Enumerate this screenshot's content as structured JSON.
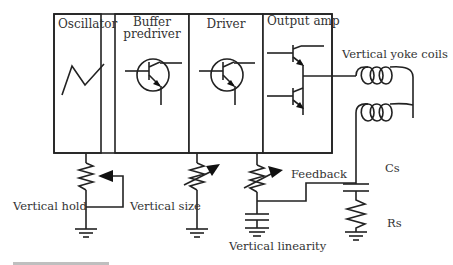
{
  "diagram": {
    "type": "circuit-block-diagram",
    "blocks": [
      {
        "id": "oscillator",
        "label_lines": [
          "Oscillator"
        ],
        "symbol": "sawtooth-waveform"
      },
      {
        "id": "buffer-predriver",
        "label_lines": [
          "Buffer",
          "predriver"
        ],
        "symbol": "npn-transistor"
      },
      {
        "id": "driver",
        "label_lines": [
          "Driver"
        ],
        "symbol": "npn-transistor"
      },
      {
        "id": "output-amp",
        "label_lines": [
          "Output amp"
        ],
        "symbol": "push-pull-transistor-pair"
      }
    ],
    "components": {
      "yoke": {
        "label": "Vertical yoke coils",
        "symbol": "two-inductors-series"
      },
      "cs": {
        "label": "Cs",
        "symbol": "capacitor"
      },
      "rs": {
        "label": "Rs",
        "symbol": "resistor"
      },
      "vertical_hold": {
        "label": "Vertical hold",
        "symbol": "potentiometer"
      },
      "vertical_size": {
        "label": "Vertical size",
        "symbol": "variable-resistor"
      },
      "vertical_linearity": {
        "label": "Vertical linearity",
        "symbol": "variable-resistor-with-capacitor"
      },
      "feedback": {
        "label": "Feedback",
        "symbol": "wire"
      }
    },
    "edges": [
      {
        "from": "oscillator",
        "to": "vertical_hold"
      },
      {
        "from": "driver",
        "to": "vertical_size"
      },
      {
        "from": "output-amp",
        "to": "vertical_linearity"
      },
      {
        "from": "output-amp",
        "to": "yoke"
      },
      {
        "from": "yoke",
        "to": "cs"
      },
      {
        "from": "cs",
        "to": "rs"
      },
      {
        "from": "rs",
        "to": "vertical_linearity",
        "label": "Feedback"
      }
    ]
  }
}
